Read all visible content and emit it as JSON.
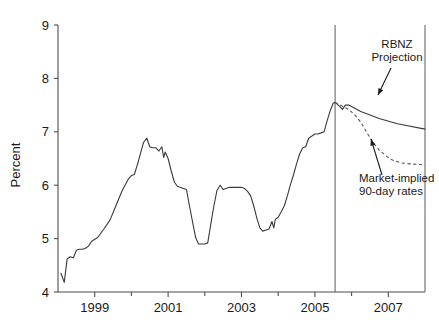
{
  "chart_data": {
    "type": "line",
    "title": "",
    "xlabel": "",
    "ylabel": "Percent",
    "ylim": [
      4,
      9
    ],
    "xlim": [
      1998.0,
      2008.0
    ],
    "grid": false,
    "legend_position": "none",
    "y_ticks": [
      "4",
      "5",
      "6",
      "7",
      "8",
      "9"
    ],
    "y_tick_values": [
      4,
      5,
      6,
      7,
      8,
      9
    ],
    "x_ticks": [
      "1999",
      "2001",
      "2003",
      "2005",
      "2007"
    ],
    "x_tick_values": [
      1999,
      2001,
      2003,
      2005,
      2007
    ],
    "x_minor_tick_values": [
      1998,
      2000,
      2002,
      2004,
      2006,
      2008
    ],
    "vertical_markers": [
      2005.55,
      2008.0
    ],
    "series": [
      {
        "name": "90-day interest rate (history and RBNZ Projection)",
        "style": "solid",
        "points": [
          [
            1998.08,
            4.35
          ],
          [
            1998.17,
            4.18
          ],
          [
            1998.25,
            4.62
          ],
          [
            1998.33,
            4.66
          ],
          [
            1998.42,
            4.64
          ],
          [
            1998.5,
            4.78
          ],
          [
            1998.58,
            4.8
          ],
          [
            1998.67,
            4.8
          ],
          [
            1998.75,
            4.82
          ],
          [
            1998.83,
            4.86
          ],
          [
            1998.92,
            4.95
          ],
          [
            1999.08,
            5.02
          ],
          [
            1999.25,
            5.18
          ],
          [
            1999.42,
            5.35
          ],
          [
            1999.58,
            5.62
          ],
          [
            1999.75,
            5.9
          ],
          [
            1999.92,
            6.12
          ],
          [
            2000.0,
            6.18
          ],
          [
            2000.08,
            6.2
          ],
          [
            2000.17,
            6.4
          ],
          [
            2000.25,
            6.6
          ],
          [
            2000.33,
            6.8
          ],
          [
            2000.42,
            6.88
          ],
          [
            2000.5,
            6.72
          ],
          [
            2000.58,
            6.7
          ],
          [
            2000.67,
            6.7
          ],
          [
            2000.75,
            6.64
          ],
          [
            2000.83,
            6.72
          ],
          [
            2000.88,
            6.52
          ],
          [
            2000.92,
            6.62
          ],
          [
            2001.0,
            6.5
          ],
          [
            2001.08,
            6.28
          ],
          [
            2001.17,
            6.06
          ],
          [
            2001.25,
            5.98
          ],
          [
            2001.33,
            5.96
          ],
          [
            2001.42,
            5.94
          ],
          [
            2001.5,
            5.92
          ],
          [
            2001.58,
            5.62
          ],
          [
            2001.67,
            5.3
          ],
          [
            2001.75,
            5.02
          ],
          [
            2001.83,
            4.9
          ],
          [
            2001.92,
            4.9
          ],
          [
            2002.0,
            4.9
          ],
          [
            2002.08,
            4.92
          ],
          [
            2002.17,
            5.3
          ],
          [
            2002.25,
            5.62
          ],
          [
            2002.33,
            5.9
          ],
          [
            2002.42,
            6.0
          ],
          [
            2002.5,
            5.92
          ],
          [
            2002.58,
            5.94
          ],
          [
            2002.67,
            5.96
          ],
          [
            2002.75,
            5.96
          ],
          [
            2002.83,
            5.96
          ],
          [
            2002.92,
            5.96
          ],
          [
            2003.0,
            5.96
          ],
          [
            2003.08,
            5.94
          ],
          [
            2003.17,
            5.88
          ],
          [
            2003.25,
            5.8
          ],
          [
            2003.33,
            5.62
          ],
          [
            2003.42,
            5.38
          ],
          [
            2003.5,
            5.2
          ],
          [
            2003.58,
            5.14
          ],
          [
            2003.67,
            5.16
          ],
          [
            2003.75,
            5.18
          ],
          [
            2003.83,
            5.32
          ],
          [
            2003.88,
            5.2
          ],
          [
            2003.92,
            5.36
          ],
          [
            2004.0,
            5.4
          ],
          [
            2004.08,
            5.5
          ],
          [
            2004.17,
            5.62
          ],
          [
            2004.25,
            5.8
          ],
          [
            2004.33,
            6.0
          ],
          [
            2004.42,
            6.2
          ],
          [
            2004.5,
            6.4
          ],
          [
            2004.58,
            6.58
          ],
          [
            2004.67,
            6.7
          ],
          [
            2004.75,
            6.72
          ],
          [
            2004.83,
            6.88
          ],
          [
            2004.92,
            6.92
          ],
          [
            2005.0,
            6.96
          ],
          [
            2005.08,
            6.96
          ],
          [
            2005.17,
            6.98
          ],
          [
            2005.25,
            7.0
          ],
          [
            2005.33,
            7.2
          ],
          [
            2005.42,
            7.4
          ],
          [
            2005.5,
            7.54
          ],
          [
            2005.55,
            7.55
          ],
          [
            2005.67,
            7.48
          ],
          [
            2005.75,
            7.42
          ],
          [
            2005.83,
            7.5
          ],
          [
            2005.92,
            7.5
          ],
          [
            2006.25,
            7.38
          ],
          [
            2006.75,
            7.25
          ],
          [
            2007.25,
            7.15
          ],
          [
            2008.0,
            7.05
          ]
        ]
      },
      {
        "name": "Market-implied 90-day rates",
        "style": "dashed",
        "points": [
          [
            2005.55,
            7.55
          ],
          [
            2005.75,
            7.48
          ],
          [
            2005.92,
            7.42
          ],
          [
            2006.08,
            7.32
          ],
          [
            2006.25,
            7.18
          ],
          [
            2006.42,
            6.98
          ],
          [
            2006.58,
            6.8
          ],
          [
            2006.75,
            6.66
          ],
          [
            2006.92,
            6.56
          ],
          [
            2007.08,
            6.48
          ],
          [
            2007.33,
            6.42
          ],
          [
            2007.58,
            6.4
          ],
          [
            2008.0,
            6.38
          ]
        ]
      }
    ],
    "annotations": [
      {
        "name": "rbnz-projection",
        "lines": [
          "RBNZ",
          "Projection"
        ],
        "text_x": 397,
        "text_y": 48,
        "arrow_from": [
          391,
          68
        ],
        "arrow_to": [
          378,
          95
        ]
      },
      {
        "name": "market-implied-rates",
        "lines": [
          "Market-implied",
          "90-day rates"
        ],
        "text_x": 359,
        "text_y": 182,
        "arrow_from": [
          382,
          175
        ],
        "arrow_to": [
          371,
          139
        ]
      }
    ]
  },
  "plot_geometry": {
    "left": 58,
    "right": 425,
    "top": 25,
    "bottom": 292
  }
}
